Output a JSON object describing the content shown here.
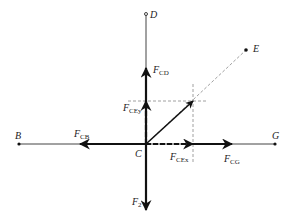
{
  "diagram": {
    "title": "",
    "points": {
      "B": {
        "label": "B",
        "x": 19,
        "y": 144
      },
      "C": {
        "label": "C",
        "x": 146,
        "y": 144
      },
      "D": {
        "label": "D",
        "x": 146,
        "y": 14
      },
      "E": {
        "label": "E",
        "x": 246,
        "y": 50
      },
      "G": {
        "label": "G",
        "x": 275,
        "y": 144
      }
    },
    "forces": {
      "F_CD": {
        "main": "F",
        "sub": "CD"
      },
      "F_CEy": {
        "main": "F",
        "sub": "CEy"
      },
      "F_CB": {
        "main": "F",
        "sub": "CB"
      },
      "F_CEx": {
        "main": "F",
        "sub": "CEx"
      },
      "F_CG": {
        "main": "F",
        "sub": "CG"
      },
      "F_2": {
        "main": "F",
        "sub": "2"
      }
    },
    "colors": {
      "line": "#333333",
      "force": "#111111",
      "dashed": "#888888"
    }
  }
}
